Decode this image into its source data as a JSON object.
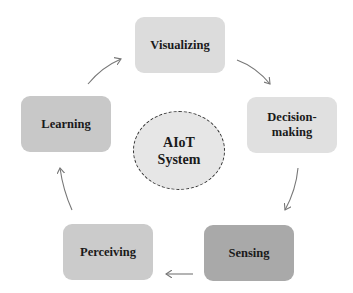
{
  "diagram": {
    "type": "cycle",
    "center": {
      "label": "AIoT\nSystem",
      "fill": "#e6e6e6",
      "border": "dashed"
    },
    "nodes": [
      {
        "id": "visualizing",
        "label": "Visualizing",
        "fill": "#dcdcdc"
      },
      {
        "id": "decision-making",
        "label": "Decision-\nmaking",
        "fill": "#e0e0e0"
      },
      {
        "id": "sensing",
        "label": "Sensing",
        "fill": "#a9a9a9"
      },
      {
        "id": "perceiving",
        "label": "Perceiving",
        "fill": "#cbcbcb"
      },
      {
        "id": "learning",
        "label": "Learning",
        "fill": "#c8c8c8"
      }
    ],
    "edges": [
      {
        "from": "visualizing",
        "to": "decision-making"
      },
      {
        "from": "decision-making",
        "to": "sensing"
      },
      {
        "from": "sensing",
        "to": "perceiving"
      },
      {
        "from": "perceiving",
        "to": "learning"
      },
      {
        "from": "learning",
        "to": "visualizing"
      }
    ],
    "arrow_color": "#777777"
  }
}
